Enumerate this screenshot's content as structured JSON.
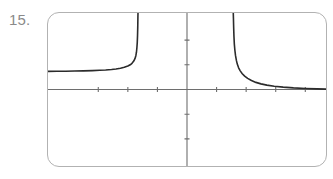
{
  "exercise": {
    "number_label": "15."
  },
  "screen": {
    "name": "graphing-calculator-screen",
    "border_color": "#b2b2b2",
    "background_color": "#ffffff",
    "corner_radius_px": 12,
    "width_px": 280,
    "height_px": 155
  },
  "chart_data": {
    "type": "line",
    "title": "",
    "xlabel": "",
    "ylabel": "",
    "grid": false,
    "legend": null,
    "axes": {
      "axis_color": "#6e6e6e",
      "x_axis_y_value": 0,
      "y_axis_x_value": 0,
      "xlim": [
        -4.7,
        4.7
      ],
      "ylim": [
        -3.1,
        3.1
      ],
      "x_tick_values": [
        -3,
        -2,
        -1,
        1,
        2,
        3,
        4
      ],
      "y_tick_values": [
        -2,
        -1,
        1,
        2
      ],
      "tick_length_px": 5,
      "tick_labels_shown": false
    },
    "curve": {
      "name": "rational-function-curve",
      "color": "#2b2b2b",
      "stroke_width_px": 1.6,
      "description": "Odd rational function with one vertical asymptote left of the y-axis and a horizontal asymptote on both sides",
      "vertical_asymptote_x": -1.62,
      "horizontal_asymptote_y": 0.72,
      "branches": [
        {
          "name": "left-branch",
          "x_range": [
            -4.7,
            -1.67
          ],
          "points": [
            [
              -4.7,
              0.735
            ],
            [
              -4.4,
              0.738
            ],
            [
              -4.1,
              0.742
            ],
            [
              -3.8,
              0.748
            ],
            [
              -3.5,
              0.755
            ],
            [
              -3.2,
              0.765
            ],
            [
              -2.95,
              0.778
            ],
            [
              -2.75,
              0.792
            ],
            [
              -2.55,
              0.812
            ],
            [
              -2.4,
              0.832
            ],
            [
              -2.25,
              0.862
            ],
            [
              -2.12,
              0.9
            ],
            [
              -2.0,
              0.95
            ],
            [
              -1.92,
              1.0
            ],
            [
              -1.86,
              1.06
            ],
            [
              -1.8,
              1.15
            ],
            [
              -1.76,
              1.25
            ],
            [
              -1.73,
              1.37
            ],
            [
              -1.71,
              1.5
            ],
            [
              -1.695,
              1.68
            ],
            [
              -1.682,
              1.9
            ],
            [
              -1.672,
              2.2
            ],
            [
              -1.665,
              2.55
            ],
            [
              -1.66,
              2.95
            ],
            [
              -1.657,
              3.1
            ]
          ]
        },
        {
          "name": "right-branch",
          "x_range": [
            -1.58,
            4.7
          ],
          "points": [
            [
              -1.565,
              -3.1
            ],
            [
              -1.57,
              -2.9
            ],
            [
              -1.578,
              -2.5
            ],
            [
              -1.588,
              -2.15
            ],
            [
              -1.6,
              -1.85
            ],
            [
              -1.618,
              -1.6
            ],
            [
              -1.64,
              -1.38
            ],
            [
              -1.67,
              -1.18
            ],
            [
              -1.7,
              -1.03
            ],
            [
              -1.745,
              -0.88
            ],
            [
              -1.8,
              -0.755
            ],
            [
              -1.87,
              -0.64
            ],
            [
              -1.95,
              -0.54
            ],
            [
              -2.05,
              -0.45
            ],
            [
              -2.18,
              -0.362
            ],
            [
              -2.33,
              -0.288
            ],
            [
              -2.5,
              -0.228
            ],
            [
              -2.7,
              -0.178
            ],
            [
              -2.95,
              -0.133
            ],
            [
              -3.25,
              -0.096
            ],
            [
              -3.6,
              -0.066
            ],
            [
              -4.0,
              -0.043
            ],
            [
              -4.4,
              -0.026
            ],
            [
              -4.7,
              -0.015
            ]
          ],
          "note": "stored mirrored; rendered as the odd reflection through the origin"
        }
      ]
    }
  }
}
